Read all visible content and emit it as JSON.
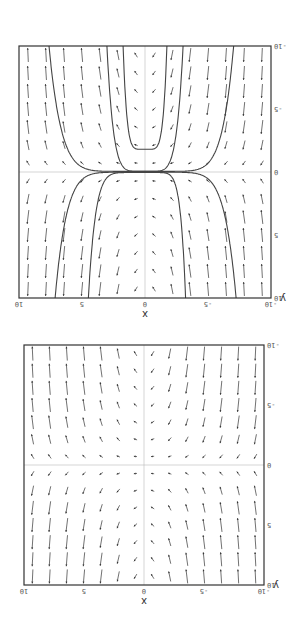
{
  "chart_data": [
    {
      "type": "direction-field",
      "title": "",
      "xlabel": "x",
      "ylabel": "y",
      "xlim": [
        -10,
        10
      ],
      "ylim": [
        -10,
        10
      ],
      "xticks": [
        -10,
        -5,
        0,
        5,
        10
      ],
      "yticks": [
        -10,
        -5,
        0,
        5,
        10
      ],
      "xtick_labels": [
        "-10",
        "-5",
        "0",
        "5",
        "10"
      ],
      "ytick_labels": [
        "-10",
        "-5",
        "0",
        "5",
        "10"
      ],
      "grid": "axes lines at x=0 and y=0",
      "field": "dy/dx = x*y (sign pattern: arrows point up where x*y>0 in displayed orientation)",
      "arrow_grid": {
        "nx": 14,
        "ny": 14
      },
      "solution_curves": [],
      "frame": {
        "left": 41,
        "top": 43,
        "right": 281,
        "bottom": 283
      }
    },
    {
      "type": "direction-field",
      "title": "",
      "xlabel": "x",
      "ylabel": "y",
      "xlim": [
        -10,
        10
      ],
      "ylim": [
        -10,
        10
      ],
      "xticks": [
        -10,
        -5,
        0,
        5,
        10
      ],
      "yticks": [
        -10,
        -5,
        0,
        5,
        10
      ],
      "xtick_labels": [
        "-10",
        "-5",
        "0",
        "5",
        "10"
      ],
      "ytick_labels": [
        "-10",
        "-5",
        "0",
        "5",
        "10"
      ],
      "grid": "axes lines at x=0 and y=0",
      "field": "dy/dx = x*y",
      "arrow_grid": {
        "nx": 14,
        "ny": 14
      },
      "solution_curves": [
        {
          "name": "u-curve-inner",
          "vertex": [
            0,
            -1.8
          ]
        },
        {
          "name": "u-curve-outer",
          "vertex": [
            0,
            -0.1
          ]
        },
        {
          "name": "left-branch-lower",
          "x_asym": -3.3
        },
        {
          "name": "right-branch-lower",
          "x_asym": 4.7
        },
        {
          "name": "left-branch-upper",
          "x_asym": -7.4
        },
        {
          "name": "right-branch-upper",
          "x_asym": 7.8
        }
      ],
      "frame": {
        "left": 34,
        "top": 330,
        "right": 286,
        "bottom": 582
      }
    }
  ],
  "colors": {
    "frame": "#333333",
    "arrow": "#333333",
    "curve": "#444444",
    "axis": "#bbbbbb"
  }
}
